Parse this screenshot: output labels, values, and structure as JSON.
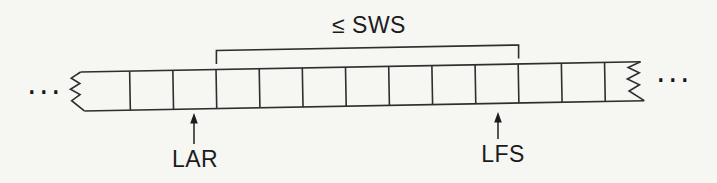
{
  "diagram": {
    "sws_label": "≤ SWS",
    "lar_label": "LAR",
    "lfs_label": "LFS",
    "left_ellipsis": "...",
    "right_ellipsis": "...",
    "cells": {
      "visible_total": 13,
      "full_cells": 11,
      "cells_under_bracket": 7
    },
    "colors": {
      "background": "#f6f6f3",
      "line": "#2e2e2e",
      "text": "#1c1c1c"
    }
  }
}
